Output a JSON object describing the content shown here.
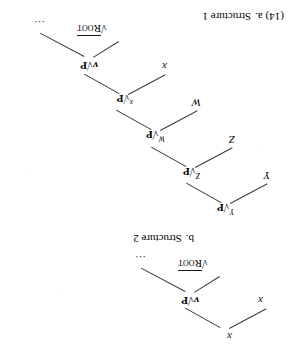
{
  "figure": {
    "example_number": "(14)",
    "orientation_note": "page scanned upside-down (rotated 180 degrees)"
  },
  "structures": [
    {
      "id": "structure-1",
      "letter": "a.",
      "title": "Structure 1",
      "caption_full": "(14) a.  Structure 1",
      "nodes": [
        {
          "key": "root",
          "text": "√Root",
          "kind": "root"
        },
        {
          "key": "ellipsis",
          "text": "…",
          "kind": "ellipsis"
        },
        {
          "key": "vp",
          "text": "v√P",
          "kind": "projection",
          "superscript": ""
        },
        {
          "key": "x_right",
          "text": "x",
          "kind": "terminal"
        },
        {
          "key": "x_top",
          "text": "x",
          "kind": "terminal"
        }
      ]
    },
    {
      "id": "structure-2",
      "letter": "b.",
      "title": "Structure 2",
      "caption_full": "b.  Structure 2",
      "nodes": [
        {
          "key": "root",
          "text": "√Root",
          "kind": "root"
        },
        {
          "key": "ellipsis",
          "text": "…",
          "kind": "ellipsis"
        },
        {
          "key": "vp",
          "text": "v√P",
          "kind": "projection"
        },
        {
          "key": "x_spec",
          "text": "x",
          "kind": "terminal"
        },
        {
          "key": "xp",
          "text": "√P",
          "kind": "projection",
          "superscript": "x"
        },
        {
          "key": "w_spec",
          "text": "W",
          "kind": "terminal"
        },
        {
          "key": "wp",
          "text": "√P",
          "kind": "projection",
          "superscript": "W"
        },
        {
          "key": "z_spec",
          "text": "Z",
          "kind": "terminal"
        },
        {
          "key": "zp",
          "text": "√P",
          "kind": "projection",
          "superscript": "Z"
        },
        {
          "key": "y_spec",
          "text": "Y",
          "kind": "terminal"
        },
        {
          "key": "yp",
          "text": "√P",
          "kind": "projection",
          "superscript": "Y"
        }
      ]
    }
  ],
  "labels": {
    "root_symbol": "√",
    "root_word": "Root",
    "p_symbol": "√P",
    "v_head": "v",
    "x": "x",
    "W": "W",
    "Z": "Z",
    "Y": "Y",
    "ellipsis": "…",
    "sup_x": "x",
    "sup_W": "W",
    "sup_Z": "Z",
    "sup_Y": "Y"
  },
  "captions": {
    "a_number": "(14)",
    "a_letter": "a.",
    "a_title": "Structure 1",
    "b_letter": "b.",
    "b_title": "Structure 2"
  },
  "colors": {
    "ink": "#000000",
    "line": "#3a3a3a",
    "paper": "#ffffff"
  }
}
